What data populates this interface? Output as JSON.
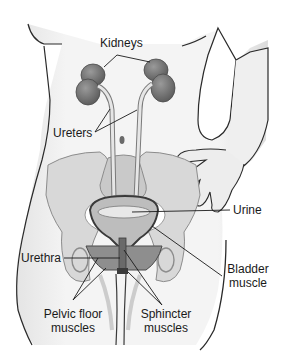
{
  "diagram": {
    "labels": {
      "kidneys": "Kidneys",
      "ureters": "Ureters",
      "urine": "Urine",
      "urethra": "Urethra",
      "bladder_muscle_line1": "Bladder",
      "bladder_muscle_line2": "muscle",
      "pelvic_floor_line1": "Pelvic floor",
      "pelvic_floor_line2": "muscles",
      "sphincter_line1": "Sphincter",
      "sphincter_line2": "muscles"
    },
    "colors": {
      "background": "#ffffff",
      "skin": "#f2f2f2",
      "outline": "#2a2a2a",
      "kidney": "#7a7a7a",
      "pelvis": "#d6d6d6",
      "bladder": "#bdbdbd",
      "muscle": "#8a8a8a",
      "leader_line": "#1a1a1a"
    }
  }
}
